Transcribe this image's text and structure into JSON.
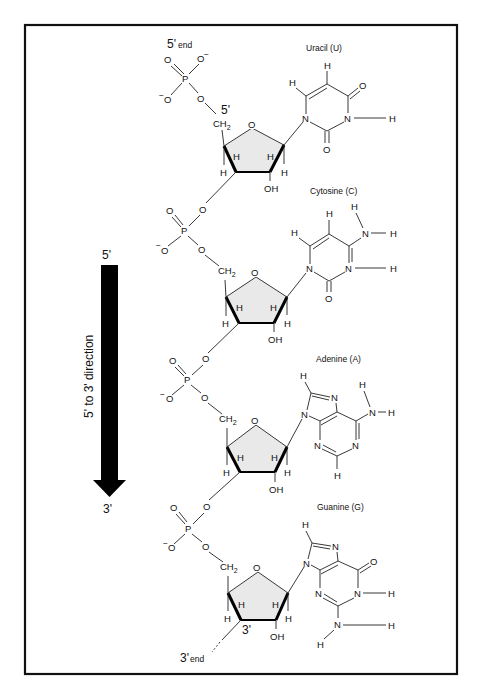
{
  "figure": {
    "frame_color": "#111111",
    "background": "#ffffff",
    "ring_fill": "#e9e9e9",
    "labels": {
      "five_prime_end": "5'",
      "five_prime_end_suffix": "end",
      "three_prime_end": "3'",
      "three_prime_end_suffix": "end",
      "five_prime_carbon": "5'",
      "three_prime_carbon": "3'"
    },
    "direction_arrow": {
      "top_label": "5'",
      "bottom_label": "3'",
      "caption": "5' to 3' direction"
    },
    "nucleotides": [
      {
        "base": "Uracil (U)"
      },
      {
        "base": "Cytosine (C)"
      },
      {
        "base": "Adenine (A)"
      },
      {
        "base": "Guanine (G)"
      }
    ],
    "atoms": {
      "O": "O",
      "O_minus": "O",
      "minus": "−",
      "P": "P",
      "N": "N",
      "H": "H",
      "OH": "OH",
      "CH": "CH",
      "sub2": "2"
    }
  }
}
